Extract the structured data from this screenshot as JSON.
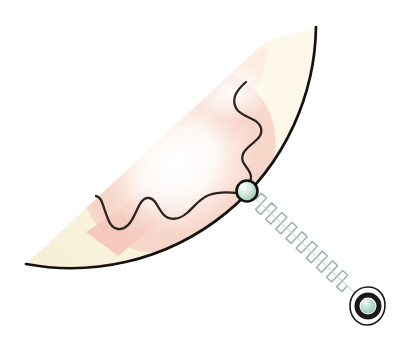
{
  "figure": {
    "title": "Single-molecule force spectroscopy schematic",
    "background_color": "#ffffff",
    "width": 412,
    "height": 351
  },
  "palette": {
    "sector_fill_cream": "#fbf6e4",
    "sector_fill_cream_deep": "#f7efd8",
    "gradient_pink": "#f6cfc6",
    "gradient_pink_soft": "#fae2dc",
    "gradient_white": "#ffffff",
    "outline_black": "#141210",
    "chain_stroke": "#2b2420",
    "bead_mint_light": "#dff0e8",
    "bead_mint": "#9ecdbb",
    "bead_mint_dark": "#7fb8a4",
    "spring_stroke": "#9ab5a4",
    "spring_stroke_light": "#c6d9cc",
    "ring_black": "#1a1714"
  },
  "elements": {
    "sector": {
      "name": "cell-sector",
      "label": "Cell sector",
      "center_x": 265,
      "center_y": 42,
      "radius": 245,
      "start_angle_deg": 132,
      "end_angle_deg": 268,
      "fill": "#fbf6e4",
      "stroke": "#141210",
      "stroke_width": 2.6,
      "arc_start_point": [
        26,
        264
      ],
      "arc_end_point": [
        316,
        27
      ]
    },
    "gradient_band": {
      "name": "pink-gradient-band",
      "label": "Pink density gradient",
      "from_color": "#f4c8be",
      "to_color": "#ffffff",
      "opacity": 0.95
    },
    "polymer_chain": {
      "name": "polymer-chain",
      "label": "Polymer chain",
      "stroke": "#2b2420",
      "stroke_width": 2.3,
      "free_end": [
        245,
        82
      ],
      "attached_end": [
        243,
        190
      ],
      "path": "M245,82 C238,94 233,101 239,111 C245,121 258,120 260,131 C262,142 248,146 244,155 C240,164 250,169 250,177 C250,184 246,187 243,190"
    },
    "polymer_chain_left": {
      "name": "polymer-chain-left-segment",
      "label": "Polymer chain inner segment",
      "stroke": "#2b2420",
      "stroke_width": 2.3,
      "path": "M236,191 C224,191 214,192 206,196 C197,200 193,207 186,213 C179,219 170,220 164,214 C158,208 157,200 150,199 C143,198 140,206 136,214 C132,222 126,229 119,228 C112,227 109,219 106,211 C103,202 101,197 97,196"
    },
    "bead_small": {
      "name": "tether-bead",
      "label": "Tethered bead",
      "cx": 247,
      "cy": 191,
      "r": 11,
      "fill_light": "#e6f3ec",
      "fill_dark": "#8cc2ae",
      "stroke": "#141210",
      "stroke_width": 2.6
    },
    "spring": {
      "name": "force-spring",
      "label": "Spring / force transducer",
      "start": [
        256,
        199
      ],
      "end": [
        358,
        296
      ],
      "coil_count": 17,
      "coil_half_width": 8.5,
      "stroke": "#9ab5a4",
      "stroke_width": 1.5
    },
    "bead_large": {
      "name": "trapped-bead",
      "label": "Trapped bead in handle",
      "cx": 368,
      "cy": 306,
      "outer_rx": 16,
      "outer_ry": 19,
      "ring_r": 11.5,
      "ring_width": 5,
      "core_r": 7.5,
      "fill_light": "#d7ece2",
      "fill_dark": "#8cc2ae",
      "outer_stroke": "#1a1714",
      "ring_stroke": "#1a1714"
    }
  }
}
